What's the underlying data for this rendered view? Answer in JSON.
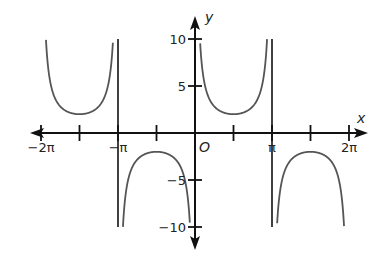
{
  "chart_data": {
    "type": "line",
    "title": "",
    "function": "y = 2 csc(x)",
    "xlabel": "x",
    "ylabel": "y",
    "origin_label": "O",
    "xlim": [
      -7.4,
      7.4
    ],
    "ylim": [
      -11.5,
      12
    ],
    "x_ticks": [
      {
        "value": -6.2832,
        "label": "−2π"
      },
      {
        "value": -4.7124,
        "label": ""
      },
      {
        "value": -3.1416,
        "label": "−π"
      },
      {
        "value": -1.5708,
        "label": ""
      },
      {
        "value": 1.5708,
        "label": ""
      },
      {
        "value": 3.1416,
        "label": "π"
      },
      {
        "value": 4.7124,
        "label": ""
      },
      {
        "value": 6.2832,
        "label": "2π"
      }
    ],
    "y_ticks": [
      {
        "value": 10,
        "label": "10"
      },
      {
        "value": 5,
        "label": "5"
      },
      {
        "value": -5,
        "label": "−5"
      },
      {
        "value": -10,
        "label": "−10"
      }
    ],
    "asymptotes": [
      -3.1416,
      0,
      3.1416
    ],
    "series": [
      {
        "name": "branch (-2π, -π)",
        "x_range": [
          -6.08,
          -3.34
        ],
        "local_extreme": {
          "x": -4.7124,
          "y": 2
        }
      },
      {
        "name": "branch (-π, 0)",
        "x_range": [
          -2.94,
          -0.2
        ],
        "local_extreme": {
          "x": -1.5708,
          "y": -2
        }
      },
      {
        "name": "branch (0, π)",
        "x_range": [
          0.2,
          2.94
        ],
        "local_extreme": {
          "x": 1.5708,
          "y": 2
        }
      },
      {
        "name": "branch (π, 2π)",
        "x_range": [
          3.34,
          6.08
        ],
        "local_extreme": {
          "x": 4.7124,
          "y": -2
        }
      }
    ],
    "grid": false,
    "legend": null,
    "colors": {
      "curve": "#555555",
      "axes": "#111111"
    }
  }
}
